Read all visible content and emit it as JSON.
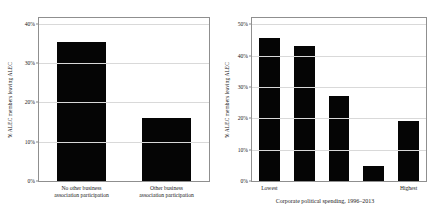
{
  "chart_data": [
    {
      "id": "left",
      "type": "bar",
      "title": "",
      "xlabel": "",
      "ylabel": "% ALEC members leaving ALEC",
      "categories": [
        "No other business\nassociation participation",
        "Other business\nassociation participation"
      ],
      "category_lines": [
        [
          "No other business",
          "association participation"
        ],
        [
          "Other business",
          "association participation"
        ]
      ],
      "values": [
        35.5,
        16.0
      ],
      "ylim": [
        0,
        41.5
      ],
      "yticks": [
        0,
        10,
        20,
        30,
        40
      ],
      "ytick_labels": [
        "0%",
        "10%",
        "20%",
        "30%",
        "40%"
      ],
      "grid": true,
      "legend": "none",
      "bar_color": "#050505"
    },
    {
      "id": "right",
      "type": "bar",
      "title": "",
      "xlabel": "Corporate political spending, 1996–2013",
      "ylabel": "% ALEC members leaving ALEC",
      "categories": [
        "Lowest",
        "",
        "",
        "",
        "Highest"
      ],
      "values": [
        45.5,
        43.0,
        27.0,
        4.7,
        19.0
      ],
      "ylim": [
        0,
        52.0
      ],
      "yticks": [
        0,
        10,
        20,
        30,
        40,
        50
      ],
      "ytick_labels": [
        "0%",
        "10%",
        "20%",
        "30%",
        "40%",
        "50%"
      ],
      "grid": true,
      "legend": "none",
      "bar_color": "#050505"
    }
  ],
  "figure": {
    "background": "#ffffff",
    "frame_color": "#8f8f8f",
    "grid_color": "#d9d9d9"
  }
}
